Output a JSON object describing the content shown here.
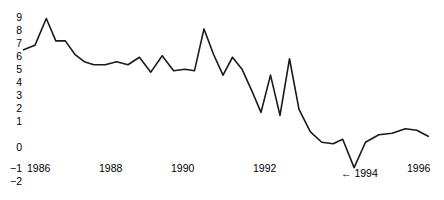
{
  "chart_data": {
    "type": "line",
    "title": "",
    "subtitle": "",
    "xlabel": "",
    "ylabel": "",
    "grid": false,
    "legend": null,
    "xlim": [
      1985.7,
      1996.6
    ],
    "ylim": [
      -2,
      9
    ],
    "yticks": [
      9,
      8,
      7,
      6,
      5,
      4,
      3,
      2,
      1,
      0,
      -1,
      -2
    ],
    "ytick_labels": [
      "9",
      "8",
      "7",
      "6",
      "5",
      "4",
      "3",
      "2",
      "1",
      "0",
      "−1",
      "−2"
    ],
    "xticks": [
      1986,
      1988,
      1990,
      1992,
      1994,
      1996
    ],
    "xtick_labels": [
      "1986",
      "1988",
      "1990",
      "1992",
      "1994",
      "1996"
    ],
    "line_color": "#1a1a1a",
    "line_width": 1.6,
    "annotations": [
      {
        "name": "arrow-1994",
        "text": "← 1994",
        "x": 1994.0,
        "y": -1.1,
        "note": "arrow pointing to trough at 1994"
      }
    ],
    "x": [
      1985.75,
      1986.05,
      1986.35,
      1986.6,
      1986.85,
      1987.1,
      1987.35,
      1987.6,
      1987.9,
      1988.2,
      1988.5,
      1988.8,
      1989.1,
      1989.4,
      1989.7,
      1990.0,
      1990.25,
      1990.5,
      1990.75,
      1991.0,
      1991.25,
      1991.5,
      1991.75,
      1992.0,
      1992.25,
      1992.5,
      1992.75,
      1993.0,
      1993.3,
      1993.6,
      1993.9,
      1994.15,
      1994.45,
      1994.75,
      1995.1,
      1995.45,
      1995.8,
      1996.1,
      1996.4
    ],
    "values": [
      6.8,
      7.1,
      8.9,
      7.4,
      7.4,
      6.5,
      6.0,
      5.8,
      5.8,
      6.0,
      5.8,
      6.3,
      5.3,
      6.4,
      5.4,
      5.5,
      5.4,
      8.2,
      6.5,
      5.1,
      6.3,
      5.5,
      4.1,
      2.6,
      5.1,
      2.4,
      6.2,
      2.8,
      1.3,
      0.6,
      0.5,
      0.8,
      -1.1,
      0.6,
      1.1,
      1.2,
      1.5,
      1.4,
      1.0
    ]
  }
}
